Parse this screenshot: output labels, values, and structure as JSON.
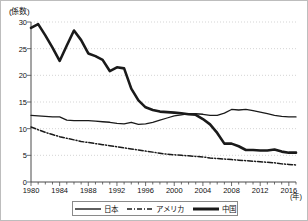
{
  "chart_data": {
    "type": "line",
    "title": "",
    "xlabel": "(年)",
    "ylabel": "(係数)",
    "xlim": [
      1980,
      2017
    ],
    "ylim": [
      0,
      30
    ],
    "ytick_labels": [
      "0",
      "5",
      "10",
      "15",
      "20",
      "25",
      "30"
    ],
    "ytick_values": [
      0,
      5,
      10,
      15,
      20,
      25,
      30
    ],
    "xtick_labels": [
      "1980",
      "1984",
      "1988",
      "1992",
      "1996",
      "2000",
      "2004",
      "2008",
      "2012",
      "2016"
    ],
    "xtick_values": [
      1980,
      1984,
      1988,
      1992,
      1996,
      2000,
      2004,
      2008,
      2012,
      2016
    ],
    "grid": "horizontal-dotted",
    "legend_position": "bottom-center",
    "x": [
      1980,
      1981,
      1982,
      1983,
      1984,
      1985,
      1986,
      1987,
      1988,
      1989,
      1990,
      1991,
      1992,
      1993,
      1994,
      1995,
      1996,
      1997,
      1998,
      1999,
      2000,
      2001,
      2002,
      2003,
      2004,
      2005,
      2006,
      2007,
      2008,
      2009,
      2010,
      2011,
      2012,
      2013,
      2014,
      2015,
      2016,
      2017
    ],
    "series": [
      {
        "name": "日本",
        "style": "thin-solid",
        "color": "#1a1a1a",
        "values": [
          12.5,
          12.4,
          12.3,
          12.2,
          12.2,
          11.6,
          11.5,
          11.5,
          11.5,
          11.4,
          11.3,
          11.2,
          11.0,
          10.9,
          11.2,
          10.8,
          10.9,
          11.2,
          11.6,
          12.0,
          12.4,
          12.6,
          12.8,
          12.8,
          12.7,
          12.5,
          12.5,
          12.9,
          13.6,
          13.5,
          13.6,
          13.4,
          13.1,
          12.8,
          12.5,
          12.3,
          12.2,
          12.2
        ]
      },
      {
        "name": "アメリカ",
        "style": "dash-dot",
        "color": "#1a1a1a",
        "values": [
          10.3,
          9.8,
          9.3,
          8.9,
          8.5,
          8.2,
          7.9,
          7.6,
          7.4,
          7.2,
          7.0,
          6.8,
          6.6,
          6.4,
          6.2,
          6.0,
          5.8,
          5.6,
          5.4,
          5.2,
          5.1,
          5.0,
          4.9,
          4.8,
          4.7,
          4.5,
          4.4,
          4.3,
          4.2,
          4.1,
          4.0,
          3.9,
          3.8,
          3.7,
          3.6,
          3.4,
          3.3,
          3.2
        ]
      },
      {
        "name": "中国",
        "style": "thick-solid",
        "color": "#1a1a1a",
        "values": [
          28.9,
          29.6,
          27.5,
          25.2,
          22.7,
          25.6,
          28.4,
          26.6,
          24.1,
          23.6,
          22.9,
          20.8,
          21.5,
          21.3,
          17.5,
          15.3,
          14.0,
          13.5,
          13.2,
          13.1,
          13.0,
          12.9,
          12.7,
          12.6,
          11.8,
          10.8,
          9.2,
          7.2,
          7.2,
          6.7,
          6.0,
          6.0,
          5.9,
          5.9,
          6.1,
          5.7,
          5.5,
          5.5
        ]
      }
    ],
    "legend_entries": [
      {
        "label": "日本",
        "style": "thin-solid"
      },
      {
        "label": "アメリカ",
        "style": "dash-dot"
      },
      {
        "label": "中国",
        "style": "thick-solid"
      }
    ]
  }
}
